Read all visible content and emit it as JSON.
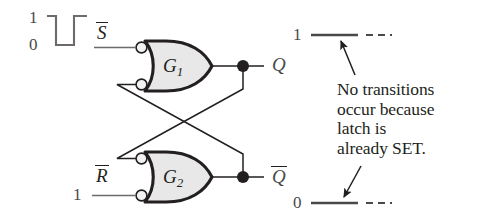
{
  "figure": {
    "kind": "nor-latch-timing-diagram",
    "background": "#ffffff",
    "ink": "#231f20",
    "gate_fill": "#e8e8e8"
  },
  "input_waveform": {
    "name": "S-bar input pulse",
    "high_level_label": "1",
    "low_level_label": "0",
    "shape": "high, falling pulse to 0, return to high"
  },
  "signals": {
    "s_bar": {
      "base_letter": "S",
      "has_overbar": true,
      "value": ""
    },
    "r_bar": {
      "base_letter": "R",
      "has_overbar": true,
      "value": "1"
    },
    "q": {
      "base_letter": "Q",
      "has_overbar": false
    },
    "q_bar": {
      "base_letter": "Q",
      "has_overbar": true
    }
  },
  "gates": [
    {
      "id": "g1",
      "base_letter": "G",
      "subscript": "1",
      "type": "nor"
    },
    {
      "id": "g2",
      "base_letter": "G",
      "subscript": "2",
      "type": "nor"
    }
  ],
  "output_waveforms": {
    "q": {
      "level_label": "1",
      "style": "solid segment then dashed continuation"
    },
    "q_bar": {
      "level_label": "0",
      "style": "solid segment then dashed continuation"
    }
  },
  "annotation": {
    "lines": [
      "No transitions",
      "occur because",
      "latch is",
      "already SET."
    ],
    "full_text": "No transitions occur because latch is already SET."
  }
}
